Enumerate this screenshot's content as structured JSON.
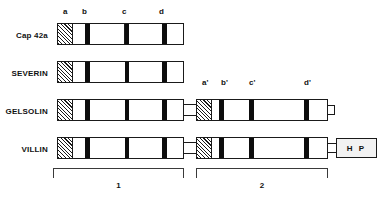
{
  "figure": {
    "title_text": "",
    "background_color": "#ffffff",
    "stroke_color": "#1a1a1a",
    "band_color": "#0d0d0d",
    "hatch_fill": "diagonal-stripes"
  },
  "domain_ticks_left": [
    {
      "label": "a",
      "x": 63
    },
    {
      "label": "b",
      "x": 82
    },
    {
      "label": "c",
      "x": 122
    },
    {
      "label": "d",
      "x": 159
    }
  ],
  "domain_ticks_right": [
    {
      "label": "a'",
      "x": 202
    },
    {
      "label": "b'",
      "x": 221
    },
    {
      "label": "c'",
      "x": 249
    },
    {
      "label": "d'",
      "x": 304
    }
  ],
  "proteins": [
    {
      "name": "Cap 42a",
      "label": "Cap 42a",
      "has_second_domain": false,
      "has_tail_stub": false,
      "has_headpiece": false,
      "headpiece_label": ""
    },
    {
      "name": "severin",
      "label": "SEVERIN",
      "has_second_domain": false,
      "has_tail_stub": false,
      "has_headpiece": false,
      "headpiece_label": ""
    },
    {
      "name": "gelsolin",
      "label": "GELSOLIN",
      "has_second_domain": true,
      "has_tail_stub": true,
      "has_headpiece": false,
      "headpiece_label": ""
    },
    {
      "name": "villin",
      "label": "VILLIN",
      "has_second_domain": true,
      "has_tail_stub": false,
      "has_headpiece": true,
      "headpiece_label": "H P"
    }
  ],
  "brackets": [
    {
      "label": "1",
      "x": 53,
      "width": 131
    },
    {
      "label": "2",
      "x": 196,
      "width": 132
    }
  ]
}
